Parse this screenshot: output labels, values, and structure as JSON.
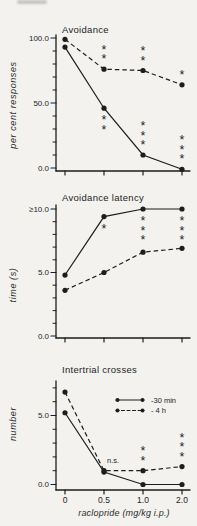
{
  "figure": {
    "xlabel": "raclopride (mg/kg i.p.)"
  },
  "chart_data": [
    {
      "type": "line",
      "title": "Avoidance",
      "ylabel": "per cent responses",
      "xlabel": "",
      "x": [
        0,
        0.5,
        1.0,
        2.0
      ],
      "ylim": [
        0,
        100
      ],
      "yticks": [
        {
          "value": 0,
          "label": "0.0"
        },
        {
          "value": 50,
          "label": "50.0"
        },
        {
          "value": 100,
          "label": "100.0"
        }
      ],
      "series": [
        {
          "name": "-30 min",
          "line": "solid",
          "values": [
            93,
            46,
            10,
            -1
          ],
          "annotations": [
            null,
            {
              "text": "**",
              "pos": "below"
            },
            {
              "text": "***",
              "pos": "above"
            },
            {
              "text": "***",
              "pos": "above"
            }
          ]
        },
        {
          "name": "- 4 h",
          "line": "dashed",
          "values": [
            99,
            76,
            75,
            64
          ],
          "annotations": [
            null,
            {
              "text": "**",
              "pos": "above"
            },
            {
              "text": "**",
              "pos": "above"
            },
            {
              "text": "*",
              "pos": "above"
            }
          ]
        }
      ]
    },
    {
      "type": "line",
      "title": "Avoidance latency",
      "ylabel": "time (s)",
      "xlabel": "",
      "x": [
        0,
        0.5,
        1.0,
        2.0
      ],
      "ylim": [
        0,
        10
      ],
      "yticks": [
        {
          "value": 0,
          "label": "0.0"
        },
        {
          "value": 5,
          "label": "5.0"
        },
        {
          "value": 10,
          "label": "≥10.0"
        }
      ],
      "series": [
        {
          "name": "-30 min",
          "line": "solid",
          "values": [
            4.8,
            9.4,
            10.0,
            10.0
          ],
          "annotations": [
            null,
            {
              "text": "*",
              "pos": "below"
            },
            {
              "text": "***",
              "pos": "below"
            },
            {
              "text": "***",
              "pos": "below"
            }
          ]
        },
        {
          "name": "- 4 h",
          "line": "dashed",
          "values": [
            3.6,
            5.0,
            6.6,
            6.9
          ],
          "annotations": [
            null,
            null,
            null,
            null
          ]
        }
      ]
    },
    {
      "type": "line",
      "title": "Intertrial crosses",
      "ylabel": "number",
      "xlabel": "raclopride (mg/kg i.p.)",
      "x": [
        0,
        0.5,
        1.0,
        2.0
      ],
      "xtick_labels": [
        "0",
        "0.5",
        "1.0",
        "2.0"
      ],
      "ylim": [
        0,
        7.5
      ],
      "yticks": [
        {
          "value": 0,
          "label": "0.0"
        },
        {
          "value": 5,
          "label": "5.0"
        }
      ],
      "series": [
        {
          "name": "-30 min",
          "line": "solid",
          "values": [
            5.2,
            0.9,
            0,
            0
          ],
          "annotations": [
            null,
            null,
            null,
            null
          ]
        },
        {
          "name": "- 4 h",
          "line": "dashed",
          "values": [
            6.7,
            1.0,
            1.0,
            1.3
          ],
          "annotations": [
            null,
            {
              "text": "n.s.",
              "pos": "above"
            },
            {
              "text": "**",
              "pos": "above"
            },
            {
              "text": "***",
              "pos": "above"
            }
          ]
        }
      ],
      "legend": {
        "entries": [
          {
            "label": "-30 min",
            "line": "solid"
          },
          {
            "label": "- 4 h",
            "line": "dashed"
          }
        ]
      }
    }
  ]
}
